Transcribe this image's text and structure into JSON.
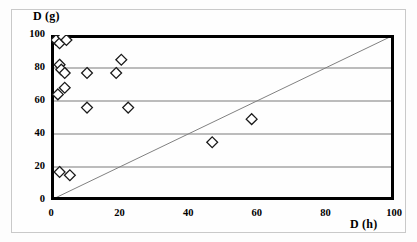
{
  "chart_data": {
    "type": "scatter",
    "title": "",
    "xlabel": "D (h)",
    "ylabel": "D (g)",
    "xlim": [
      0,
      100
    ],
    "ylim": [
      0,
      100
    ],
    "xticks": [
      0,
      20,
      40,
      60,
      80,
      100
    ],
    "yticks": [
      0,
      20,
      40,
      60,
      80,
      100
    ],
    "grid": "horizontal gridlines at y = 20, 40, 60, 80",
    "legend": "none",
    "marker": "open diamond",
    "marker_color": "#ffffff",
    "marker_edge_color": "#000000",
    "reference_line": {
      "label": "y = x identity line",
      "from": [
        0,
        0
      ],
      "to": [
        100,
        100
      ],
      "color": "#808080",
      "style": "thin solid"
    },
    "points": [
      {
        "x": 1.5,
        "y": 97
      },
      {
        "x": 2.5,
        "y": 95
      },
      {
        "x": 3.5,
        "y": 99
      },
      {
        "x": 4.5,
        "y": 97
      },
      {
        "x": 2.5,
        "y": 82
      },
      {
        "x": 3.0,
        "y": 79
      },
      {
        "x": 4.0,
        "y": 77
      },
      {
        "x": 2.0,
        "y": 64
      },
      {
        "x": 4.0,
        "y": 68
      },
      {
        "x": 10.5,
        "y": 77
      },
      {
        "x": 10.5,
        "y": 56
      },
      {
        "x": 19.0,
        "y": 77
      },
      {
        "x": 20.5,
        "y": 85
      },
      {
        "x": 22.5,
        "y": 56
      },
      {
        "x": 47.0,
        "y": 35
      },
      {
        "x": 58.5,
        "y": 49
      },
      {
        "x": 2.5,
        "y": 17
      },
      {
        "x": 5.5,
        "y": 15
      }
    ]
  },
  "axes": {
    "y_title": "D (g)",
    "x_title": "D (h)",
    "y_tick_labels": [
      "100",
      "80",
      "60",
      "40",
      "20",
      "0"
    ],
    "x_tick_labels": [
      "0",
      "20",
      "40",
      "60",
      "80",
      "100"
    ]
  },
  "colors": {
    "axis": "#000000",
    "gridline": "#7a7a7a",
    "reference_line": "#8c8c8c",
    "marker_fill": "#ffffff",
    "marker_stroke": "#1a1a1a",
    "frame": "#c9c9c9",
    "background": "#fefefe"
  }
}
